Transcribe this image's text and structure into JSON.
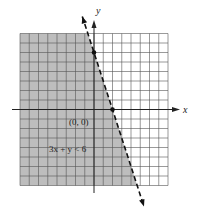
{
  "chart_data": {
    "type": "scatter",
    "title": "",
    "xlabel": "x",
    "ylabel": "y",
    "xlim": [
      -8,
      8
    ],
    "ylim": [
      -8,
      8
    ],
    "grid": true,
    "boundary_line": {
      "equation": "3x + y = 6",
      "style": "dashed",
      "points": [
        [
          0,
          6
        ],
        [
          2,
          0
        ]
      ]
    },
    "shaded_region": "3x + y < 6",
    "test_point": {
      "label": "(0, 0)",
      "x": 0,
      "y": 0
    },
    "annotations": [
      "(0, 0)",
      "3x + y < 6"
    ]
  },
  "labels": {
    "x_axis": "x",
    "y_axis": "y",
    "test_point": "(0, 0)",
    "inequality": "3x + y < 6"
  },
  "colors": {
    "shade": "#bdbdbd",
    "grid": "#555555",
    "axis": "#222222",
    "line": "#111111"
  }
}
